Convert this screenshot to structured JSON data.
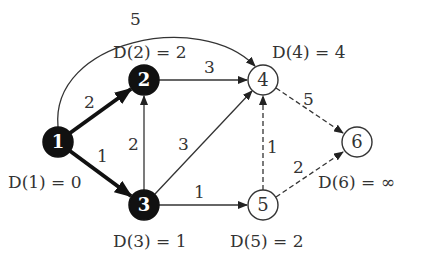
{
  "graph": {
    "nodes": [
      {
        "id": "1",
        "label": "1",
        "x": 58,
        "y": 142,
        "filled": true,
        "distance": "D(1) = 0"
      },
      {
        "id": "2",
        "label": "2",
        "x": 144,
        "y": 80,
        "filled": true,
        "distance": "D(2) = 2"
      },
      {
        "id": "3",
        "label": "3",
        "x": 144,
        "y": 205,
        "filled": true,
        "distance": "D(3) = 1"
      },
      {
        "id": "4",
        "label": "4",
        "x": 263,
        "y": 80,
        "filled": false,
        "distance": "D(4) = 4"
      },
      {
        "id": "5",
        "label": "5",
        "x": 263,
        "y": 205,
        "filled": false,
        "distance": "D(5) = 2"
      },
      {
        "id": "6",
        "label": "6",
        "x": 357,
        "y": 142,
        "filled": false,
        "distance": "D(6) = ∞"
      }
    ],
    "edges": [
      {
        "from": "1",
        "to": "2",
        "weight": "2",
        "style": "bold"
      },
      {
        "from": "1",
        "to": "3",
        "weight": "1",
        "style": "bold"
      },
      {
        "from": "1",
        "to": "4",
        "weight": "5",
        "style": "curved"
      },
      {
        "from": "2",
        "to": "4",
        "weight": "3",
        "style": "solid"
      },
      {
        "from": "3",
        "to": "2",
        "weight": "2",
        "style": "solid"
      },
      {
        "from": "3",
        "to": "4",
        "weight": "3",
        "style": "solid"
      },
      {
        "from": "3",
        "to": "5",
        "weight": "1",
        "style": "solid"
      },
      {
        "from": "4",
        "to": "6",
        "weight": "5",
        "style": "dashed"
      },
      {
        "from": "5",
        "to": "4",
        "weight": "1",
        "style": "dashed"
      },
      {
        "from": "5",
        "to": "6",
        "weight": "2",
        "style": "dashed"
      }
    ]
  },
  "labels": {
    "n1": "1",
    "n2": "2",
    "n3": "3",
    "n4": "4",
    "n5": "5",
    "n6": "6",
    "w12": "2",
    "w13": "1",
    "w14": "5",
    "w24": "3",
    "w32": "2",
    "w34": "3",
    "w35": "1",
    "w46": "5",
    "w54": "1",
    "w56": "2",
    "d1": "D(1) = 0",
    "d2": "D(2) = 2",
    "d3": "D(3) = 1",
    "d4": "D(4) = 4",
    "d5": "D(5) = 2",
    "d6": "D(6) = ∞"
  },
  "colors": {
    "ink": "#222222",
    "fill": "#111111",
    "bg": "#ffffff"
  }
}
